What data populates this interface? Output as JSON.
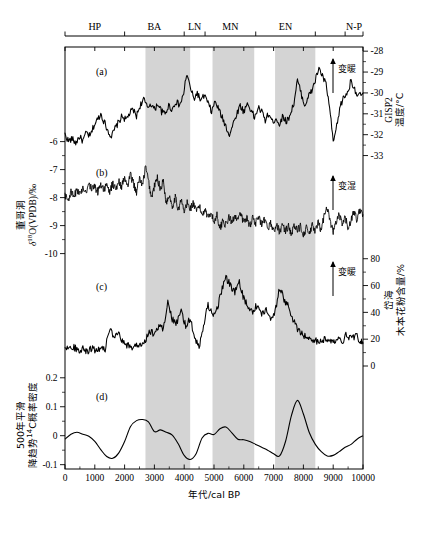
{
  "figure": {
    "panel_labels": [
      "(a)",
      "(b)",
      "(c)",
      "(d)"
    ],
    "annotations": {
      "warming_a": "变暖",
      "wetter_b": "变湿",
      "warming_c": "变暖"
    },
    "caption": ""
  },
  "top_axis": {
    "name": "cultural-periods",
    "labels": [
      "HP",
      "BA",
      "LN",
      "MN",
      "EN",
      "N-P"
    ],
    "boundaries": [
      0,
      2000,
      4000,
      4700,
      6400,
      8400,
      9400,
      10000
    ],
    "label_centers": [
      1000,
      3000,
      4350,
      5550,
      7400,
      9700
    ]
  },
  "x_axis": {
    "title": "年代/cal BP",
    "min": 0,
    "max": 10000,
    "ticks": [
      0,
      1000,
      2000,
      3000,
      4000,
      5000,
      6000,
      7000,
      8000,
      9000,
      10000
    ],
    "tick_labels": [
      "0",
      "1000",
      "2000",
      "3000",
      "4000",
      "5000",
      "6000",
      "7000",
      "8000",
      "9000",
      "10000"
    ]
  },
  "shaded_bands": [
    {
      "start": 2700,
      "end": 4200
    },
    {
      "start": 4950,
      "end": 6350
    },
    {
      "start": 7050,
      "end": 8400
    }
  ],
  "axes": {
    "left_b": {
      "title_cn": "董哥洞",
      "title_sym": "δ18O(VPDB)/‰",
      "ticks": [
        -10,
        -9,
        -8,
        -7,
        -6
      ],
      "tick_labels": [
        "-10",
        "-9",
        "-8",
        "-7",
        "-6"
      ]
    },
    "left_d": {
      "title_line1": "500年平滑",
      "title_line2": "降趋势14C概率密度",
      "ticks": [
        -0.1,
        0,
        0.1,
        0.2
      ],
      "tick_labels": [
        "-0.1",
        "0",
        "0.1",
        "0.2"
      ]
    },
    "right_a": {
      "title_line1": "GISP2",
      "title_line2": "温度/°C",
      "ticks": [
        -28,
        -29,
        -30,
        -31,
        -32,
        -33
      ],
      "tick_labels": [
        "-28",
        "-29",
        "-30",
        "-31",
        "-32",
        "-33"
      ]
    },
    "right_c": {
      "title_line1": "岱海",
      "title_line2": "木本花粉含量/%",
      "ticks": [
        0,
        20,
        40,
        60,
        80
      ],
      "tick_labels": [
        "0",
        "20",
        "40",
        "60",
        "80"
      ]
    }
  },
  "chart_data": {
    "type": "line",
    "title": "",
    "xlabel": "年代/cal BP",
    "xlim": [
      0,
      10000
    ],
    "grid": false,
    "legend": "none",
    "panels": [
      {
        "id": "a",
        "label": "(a)",
        "name": "GISP2 温度",
        "ylabel": "GISP2 温度/°C",
        "ylim": [
          -33.5,
          -27.8
        ],
        "yticks": [
          -28,
          -29,
          -30,
          -31,
          -32,
          -33
        ],
        "axis_side": "right",
        "annotation": "变暖",
        "x": [
          0,
          120,
          240,
          360,
          480,
          600,
          720,
          840,
          960,
          1080,
          1200,
          1320,
          1440,
          1560,
          1680,
          1800,
          1920,
          2040,
          2160,
          2280,
          2400,
          2520,
          2640,
          2760,
          2880,
          3000,
          3120,
          3240,
          3360,
          3480,
          3600,
          3720,
          3840,
          3960,
          4080,
          4200,
          4320,
          4440,
          4560,
          4680,
          4800,
          4920,
          5040,
          5160,
          5280,
          5400,
          5520,
          5640,
          5760,
          5880,
          6000,
          6120,
          6240,
          6360,
          6480,
          6600,
          6720,
          6840,
          6960,
          7080,
          7200,
          7320,
          7440,
          7560,
          7680,
          7800,
          7920,
          8040,
          8160,
          8280,
          8400,
          8520,
          8640,
          8760,
          8880,
          9000,
          9120,
          9240,
          9360,
          9480,
          9600,
          9720,
          9840,
          10000
        ],
        "y": [
          -32.0,
          -32.3,
          -32.2,
          -32.4,
          -32.1,
          -32.3,
          -31.9,
          -32.1,
          -31.6,
          -31.3,
          -31.0,
          -31.4,
          -31.8,
          -32.1,
          -31.7,
          -31.4,
          -31.1,
          -31.3,
          -31.0,
          -30.8,
          -31.1,
          -30.6,
          -30.3,
          -30.7,
          -30.5,
          -30.8,
          -30.5,
          -30.9,
          -31.0,
          -30.6,
          -30.8,
          -30.4,
          -30.6,
          -30.2,
          -29.1,
          -29.7,
          -30.3,
          -30.0,
          -30.4,
          -30.1,
          -30.5,
          -30.9,
          -30.4,
          -30.8,
          -31.2,
          -31.6,
          -32.0,
          -31.5,
          -31.0,
          -30.6,
          -30.9,
          -30.5,
          -30.8,
          -31.2,
          -30.7,
          -30.9,
          -31.3,
          -31.0,
          -31.4,
          -31.2,
          -31.5,
          -31.1,
          -31.4,
          -31.0,
          -30.5,
          -29.4,
          -30.0,
          -30.6,
          -30.2,
          -29.9,
          -29.4,
          -28.8,
          -29.2,
          -29.6,
          -30.7,
          -32.4,
          -31.6,
          -30.6,
          -30.2,
          -30.0,
          -29.4,
          -29.8,
          -30.2,
          -30.0
        ]
      },
      {
        "id": "b",
        "label": "(b)",
        "name": "董哥洞 δ18O",
        "ylabel": "董哥洞 δ18O(VPDB)/‰",
        "ylim": [
          -10.3,
          -6.3
        ],
        "yticks": [
          -10,
          -9,
          -8,
          -7,
          -6
        ],
        "axis_side": "left",
        "annotation": "变湿",
        "x": [
          0,
          100,
          200,
          300,
          400,
          500,
          600,
          700,
          800,
          900,
          1000,
          1100,
          1200,
          1300,
          1400,
          1500,
          1600,
          1700,
          1800,
          1900,
          2000,
          2100,
          2200,
          2300,
          2400,
          2500,
          2600,
          2700,
          2800,
          2900,
          3000,
          3100,
          3200,
          3300,
          3400,
          3500,
          3600,
          3700,
          3800,
          3900,
          4000,
          4100,
          4200,
          4300,
          4400,
          4500,
          4600,
          4700,
          4800,
          4900,
          5000,
          5100,
          5200,
          5300,
          5400,
          5500,
          5600,
          5700,
          5800,
          5900,
          6000,
          6100,
          6200,
          6300,
          6400,
          6500,
          6600,
          6700,
          6800,
          6900,
          7000,
          7100,
          7200,
          7300,
          7400,
          7500,
          7600,
          7700,
          7800,
          7900,
          8000,
          8100,
          8200,
          8300,
          8400,
          8500,
          8600,
          8700,
          8800,
          8900,
          9000,
          9100,
          9200,
          9300,
          9400,
          9500,
          9600,
          9700,
          9800,
          9900,
          10000
        ],
        "y": [
          -7.9,
          -8.1,
          -7.8,
          -8.0,
          -7.7,
          -7.9,
          -7.6,
          -7.8,
          -7.5,
          -7.7,
          -7.6,
          -7.8,
          -7.5,
          -7.7,
          -7.6,
          -7.8,
          -7.5,
          -7.7,
          -7.4,
          -7.6,
          -7.3,
          -7.6,
          -7.2,
          -7.5,
          -7.8,
          -7.3,
          -7.6,
          -6.9,
          -7.4,
          -8.0,
          -7.6,
          -7.3,
          -7.7,
          -7.4,
          -8.2,
          -7.9,
          -8.3,
          -8.0,
          -8.4,
          -8.1,
          -8.5,
          -8.2,
          -8.4,
          -8.2,
          -8.5,
          -8.3,
          -8.6,
          -8.4,
          -8.7,
          -8.5,
          -8.9,
          -8.6,
          -9.1,
          -8.8,
          -9.0,
          -8.7,
          -8.9,
          -8.6,
          -8.8,
          -8.6,
          -8.9,
          -8.7,
          -9.0,
          -8.7,
          -8.9,
          -8.7,
          -9.0,
          -8.8,
          -9.1,
          -8.9,
          -9.2,
          -9.0,
          -9.2,
          -9.0,
          -9.2,
          -9.0,
          -9.3,
          -9.0,
          -9.2,
          -9.0,
          -9.3,
          -9.1,
          -9.3,
          -9.0,
          -9.2,
          -8.9,
          -9.2,
          -8.6,
          -8.3,
          -8.9,
          -9.2,
          -8.9,
          -8.6,
          -9.0,
          -8.7,
          -9.1,
          -8.8,
          -8.5,
          -8.8,
          -8.4,
          -8.6
        ]
      },
      {
        "id": "c",
        "label": "(c)",
        "name": "岱海 木本花粉含量",
        "ylabel": "岱海 木本花粉含量/%",
        "ylim": [
          0,
          88
        ],
        "yticks": [
          0,
          20,
          40,
          60,
          80
        ],
        "axis_side": "right",
        "annotation": "变暖",
        "x": [
          0,
          150,
          300,
          450,
          600,
          750,
          900,
          1050,
          1200,
          1350,
          1500,
          1650,
          1800,
          1950,
          2100,
          2250,
          2400,
          2550,
          2700,
          2850,
          3000,
          3150,
          3300,
          3450,
          3600,
          3750,
          3900,
          4050,
          4200,
          4350,
          4500,
          4650,
          4800,
          4950,
          5100,
          5250,
          5400,
          5550,
          5700,
          5850,
          6000,
          6150,
          6300,
          6450,
          6600,
          6750,
          6900,
          7050,
          7200,
          7350,
          7500,
          7650,
          7800,
          7950,
          8100,
          8250,
          8400,
          8550,
          8700,
          8850,
          9000,
          9150,
          9300,
          9450,
          9600,
          9750,
          9900,
          10000
        ],
        "y": [
          15,
          13,
          14,
          12,
          13,
          11,
          13,
          12,
          14,
          13,
          28,
          20,
          24,
          17,
          15,
          14,
          16,
          15,
          20,
          26,
          24,
          30,
          28,
          48,
          35,
          32,
          40,
          30,
          36,
          20,
          14,
          30,
          46,
          38,
          42,
          56,
          66,
          60,
          55,
          62,
          50,
          44,
          40,
          46,
          38,
          42,
          36,
          40,
          58,
          50,
          44,
          34,
          28,
          24,
          22,
          20,
          19,
          18,
          20,
          19,
          17,
          22,
          18,
          24,
          20,
          23,
          19,
          17
        ]
      },
      {
        "id": "d",
        "label": "(d)",
        "name": "14C概率密度 500年平滑",
        "ylabel": "500年平滑 降趋势14C概率密度",
        "ylim": [
          -0.115,
          0.22
        ],
        "yticks": [
          -0.1,
          0,
          0.1,
          0.2
        ],
        "axis_side": "left",
        "annotation": "",
        "x": [
          0,
          200,
          400,
          600,
          800,
          1000,
          1200,
          1400,
          1600,
          1800,
          2000,
          2200,
          2400,
          2600,
          2800,
          3000,
          3200,
          3400,
          3600,
          3800,
          4000,
          4200,
          4400,
          4600,
          4800,
          5000,
          5200,
          5400,
          5600,
          5800,
          6000,
          6200,
          6400,
          6600,
          6800,
          7000,
          7200,
          7400,
          7600,
          7800,
          8000,
          8200,
          8400,
          8600,
          8800,
          9000,
          9200,
          9400,
          9600,
          9800,
          10000
        ],
        "y": [
          -0.012,
          0.005,
          0.012,
          0.005,
          -0.002,
          -0.02,
          -0.048,
          -0.072,
          -0.078,
          -0.06,
          -0.02,
          0.032,
          0.052,
          0.056,
          0.048,
          0.014,
          0.02,
          0.012,
          0.002,
          -0.028,
          -0.068,
          -0.082,
          -0.062,
          -0.008,
          0.008,
          0.004,
          0.024,
          0.03,
          0.01,
          -0.012,
          -0.014,
          -0.02,
          -0.03,
          -0.04,
          -0.05,
          -0.062,
          -0.07,
          -0.02,
          0.07,
          0.122,
          0.075,
          0.01,
          -0.03,
          -0.055,
          -0.07,
          -0.068,
          -0.055,
          -0.04,
          -0.03,
          -0.012,
          0.0
        ]
      }
    ]
  }
}
